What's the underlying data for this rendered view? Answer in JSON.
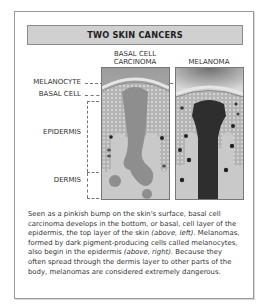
{
  "title": "TWO SKIN CANCERS",
  "columns": {
    "left": {
      "line1": "BASAL CELL",
      "line2": "CARCINOMA"
    },
    "right": {
      "label": "MELANOMA"
    }
  },
  "side_labels": {
    "melanocyte": "MELANOCYTE",
    "basal_cell": "BASAL CELL",
    "epidermis": "EPIDERMIS",
    "dermis": "DERMIS"
  },
  "caption": {
    "part1": "Seen as a pinkish bump on the skin's surface, basal cell carcinoma develops in the bottom, or basal, cell layer of the epidermis, the top layer of the skin ",
    "em1": "(above, left).",
    "part2": " Melanomas, formed by dark pigment-producing cells called melanocytes, also begin in the epidermis ",
    "em2": "(above, right).",
    "part3": " Because they often spread through the dermis layer to other parts of the body, melanomas are considered extremely dangerous."
  },
  "colors": {
    "title_bg": "#d0d0d0",
    "frame_border": "#9a9a9a",
    "dermis": "#c9c9c9",
    "epidermis": "#a9a9a9",
    "tumor_basal": "#8e8e8e",
    "tumor_melanoma": "#2e2e2e"
  }
}
